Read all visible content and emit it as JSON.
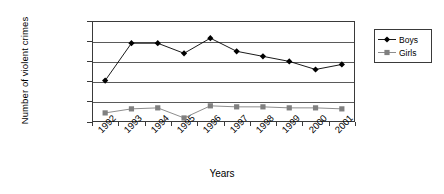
{
  "chart_data": {
    "type": "line",
    "title": "",
    "xlabel": "Years",
    "ylabel": "Number of violent crimes",
    "categories": [
      "1992",
      "1993",
      "1994",
      "1995",
      "1996",
      "1997",
      "1998",
      "1999",
      "2000",
      "2001"
    ],
    "ylim": [
      0,
      100000
    ],
    "ytick_step": 20000,
    "yticks": [
      "100000",
      "80000",
      "60000",
      "40000",
      "20000",
      "0"
    ],
    "ytick_values": [
      100000,
      80000,
      60000,
      40000,
      20000,
      0
    ],
    "grid": "horizontal",
    "legend_position": "right",
    "series": [
      {
        "name": "Boys",
        "marker": "diamond",
        "color": "#000000",
        "values": [
          41000,
          78000,
          78000,
          68000,
          83000,
          70000,
          65000,
          60000,
          52000,
          57000
        ]
      },
      {
        "name": "Girls",
        "marker": "square",
        "color": "#808080",
        "values": [
          9000,
          13000,
          14000,
          4000,
          16000,
          15000,
          15000,
          14000,
          14000,
          13000
        ]
      }
    ]
  },
  "legend": {
    "items": [
      {
        "label": "Boys",
        "marker": "diamond-marker-icon"
      },
      {
        "label": "Girls",
        "marker": "square-marker-icon"
      }
    ]
  }
}
